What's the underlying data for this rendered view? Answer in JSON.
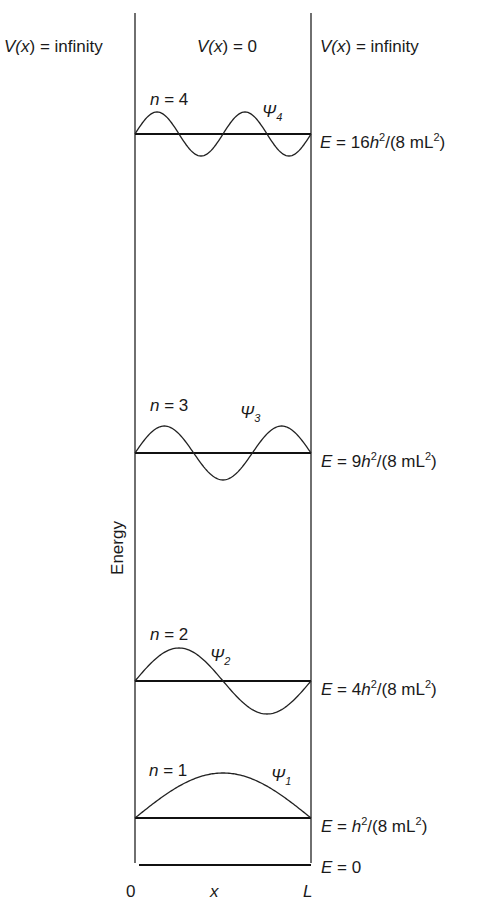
{
  "chart_data": {
    "type": "diagram",
    "regions": [
      {
        "label_pre": "V(",
        "label_var": "x",
        "label_post": ") = infinity",
        "position": "left"
      },
      {
        "label_pre": "V(",
        "label_var": "x",
        "label_post": ") = 0",
        "position": "middle"
      },
      {
        "label_pre": "V(",
        "label_var": "x",
        "label_post": ") = infinity",
        "position": "right"
      }
    ],
    "ylabel": "Energy",
    "x_axis": {
      "left": "0",
      "middle": "x",
      "right": "L"
    },
    "levels": [
      {
        "n": 1,
        "n_label": "n = 1",
        "psi_sub": "1",
        "energy_coef": "",
        "energy_relative": 1,
        "y_px": 818,
        "amplitude_px": 45
      },
      {
        "n": 2,
        "n_label": "n = 2",
        "psi_sub": "2",
        "energy_coef": "4",
        "energy_relative": 4,
        "y_px": 681,
        "amplitude_px": 33
      },
      {
        "n": 3,
        "n_label": "n = 3",
        "psi_sub": "3",
        "energy_coef": "9",
        "energy_relative": 9,
        "y_px": 453,
        "amplitude_px": 27
      },
      {
        "n": 4,
        "n_label": "n = 4",
        "psi_sub": "4",
        "energy_coef": "16",
        "energy_relative": 16,
        "y_px": 134,
        "amplitude_px": 22
      }
    ],
    "ground": {
      "label": "E = 0",
      "y_px": 865
    },
    "energy_formula": "E = n²h²/(8mL²)"
  },
  "labels": {
    "v_left": {
      "pre": "V(",
      "var": "x",
      "post": ") = infinity"
    },
    "v_mid": {
      "pre": "V(",
      "var": "x",
      "post": ") = 0"
    },
    "v_right": {
      "pre": "V(",
      "var": "x",
      "post": ") = infinity"
    },
    "energy_axis": "Energy",
    "axis_zero": "0",
    "axis_x": "x",
    "axis_L": "L",
    "n_var": "n",
    "eq": " = ",
    "n1": "1",
    "n2": "2",
    "n3": "3",
    "n4": "4",
    "psi": "Ψ",
    "E": "E",
    "h": "h",
    "sq": "2",
    "mid": "/(8 mL",
    "close": ")",
    "coef2": "4",
    "coef3": "9",
    "coef4": "16",
    "e0_val": "0"
  }
}
